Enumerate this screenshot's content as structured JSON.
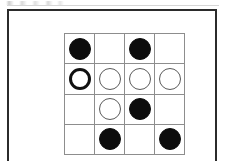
{
  "figure": {
    "kind": "board-diagram",
    "frame": {
      "border_color": "#2b2b2b",
      "background_color": "#ffffff"
    },
    "board": {
      "rows": 4,
      "columns": 4,
      "grid_line_color": "#8d8d8d",
      "black_stone_color": "#0d0d0d",
      "white_stone_color": "#ffffff",
      "white_stone_outline_color": "#5a5a5a",
      "emphasis_outline_color": "#101010",
      "cells": [
        [
          {
            "state": "black",
            "emphasis": false,
            "label": "black-stone"
          },
          {
            "state": "empty",
            "emphasis": false,
            "label": "empty-cell"
          },
          {
            "state": "black",
            "emphasis": false,
            "label": "black-stone"
          },
          {
            "state": "empty",
            "emphasis": false,
            "label": "empty-cell"
          }
        ],
        [
          {
            "state": "white",
            "emphasis": true,
            "label": "white-stone-highlighted"
          },
          {
            "state": "white",
            "emphasis": false,
            "label": "white-stone"
          },
          {
            "state": "white",
            "emphasis": false,
            "label": "white-stone"
          },
          {
            "state": "white",
            "emphasis": false,
            "label": "white-stone"
          }
        ],
        [
          {
            "state": "empty",
            "emphasis": false,
            "label": "empty-cell"
          },
          {
            "state": "white",
            "emphasis": false,
            "label": "white-stone"
          },
          {
            "state": "black",
            "emphasis": false,
            "label": "black-stone"
          },
          {
            "state": "empty",
            "emphasis": false,
            "label": "empty-cell"
          }
        ],
        [
          {
            "state": "empty",
            "emphasis": false,
            "label": "empty-cell"
          },
          {
            "state": "black",
            "emphasis": false,
            "label": "black-stone"
          },
          {
            "state": "empty",
            "emphasis": false,
            "label": "empty-cell"
          },
          {
            "state": "black",
            "emphasis": false,
            "label": "black-stone"
          }
        ]
      ]
    },
    "artifacts": {
      "top_speckle": true,
      "top_rule": true
    }
  }
}
